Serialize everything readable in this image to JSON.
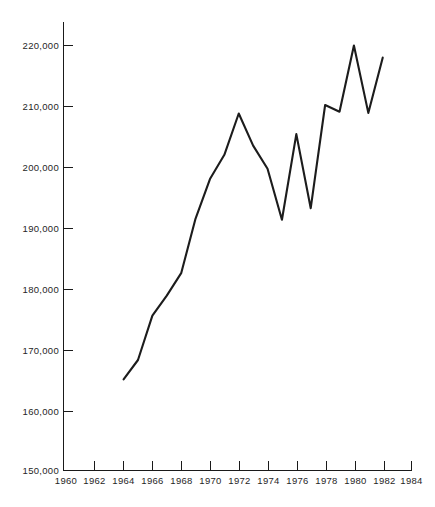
{
  "chart_data": {
    "type": "line",
    "title": "",
    "subtitle": "",
    "xlabel": "",
    "ylabel": "",
    "xlim": [
      1960,
      1984
    ],
    "ylim": [
      150000,
      224000
    ],
    "x_ticks": [
      1960,
      1962,
      1964,
      1966,
      1968,
      1970,
      1972,
      1974,
      1976,
      1978,
      1980,
      1982,
      1984
    ],
    "x_tick_labels": [
      "1960",
      "1962",
      "1964",
      "1966",
      "1968",
      "1970",
      "1972",
      "1974",
      "1976",
      "1978",
      "1980",
      "1982",
      "1984"
    ],
    "y_ticks": [
      150000,
      160000,
      170000,
      180000,
      190000,
      200000,
      210000,
      220000
    ],
    "y_tick_labels": [
      "150,000",
      "160,000",
      "170,000",
      "180,000",
      "190,000",
      "200,000",
      "210,000",
      "220,000"
    ],
    "grid": false,
    "legend": false,
    "legend_position": "none",
    "line_color": "#1c1c1c",
    "x": [
      1964,
      1965,
      1966,
      1967,
      1968,
      1969,
      1970,
      1971,
      1972,
      1973,
      1974,
      1975,
      1976,
      1977,
      1978,
      1979,
      1980,
      1981,
      1982
    ],
    "values": [
      165000,
      168200,
      175500,
      178800,
      182500,
      191500,
      198000,
      202000,
      208800,
      203500,
      199700,
      191300,
      205400,
      193200,
      210200,
      209100,
      220000,
      208900,
      218000
    ],
    "series": [
      {
        "name": "series-1",
        "values": [
          165000,
          168200,
          175500,
          178800,
          182500,
          191500,
          198000,
          202000,
          208800,
          203500,
          199700,
          191300,
          205400,
          193200,
          210200,
          209100,
          220000,
          208900,
          218000
        ]
      }
    ],
    "annotations": []
  },
  "caption": {
    "text": ""
  }
}
